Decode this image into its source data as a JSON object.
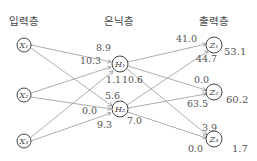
{
  "headers": {
    "input": "입력층",
    "hidden": "은닉층",
    "output": "출력층"
  },
  "nodes": {
    "input": [
      {
        "label": "X₁"
      },
      {
        "label": "X₂"
      },
      {
        "label": "X₃"
      }
    ],
    "hidden": [
      {
        "label": "H₁"
      },
      {
        "label": "H₂"
      }
    ],
    "output": [
      {
        "label": "Z₁",
        "value": "53.1"
      },
      {
        "label": "Z₂",
        "value": "60.2"
      },
      {
        "label": "Z₃",
        "value": "1.7"
      }
    ]
  },
  "weights": {
    "x1_h1": "8.9",
    "x2_h1": "10.3",
    "x3_h1": "1.1",
    "x1_h2": "5.6",
    "x2_h2": "0.0",
    "x3_h2": "9.3",
    "h1_z1": "41.0",
    "h2_z1": "44.7",
    "h1_z2": "0.0",
    "h2_z2": "63.5",
    "h1_z3": "10.6",
    "h2_z3": "7.0",
    "z3_top": "3.9",
    "z3_bottom": "0.0"
  },
  "colors": {
    "line": "#888888",
    "node": "#444444",
    "text": "#555555"
  }
}
